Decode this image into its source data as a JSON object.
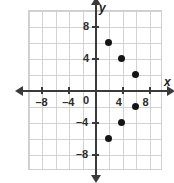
{
  "chart_data": {
    "type": "scatter",
    "title": "",
    "xlabel": "x",
    "ylabel": "y",
    "xlim": [
      -10,
      10
    ],
    "ylim": [
      -10,
      10
    ],
    "grid": true,
    "grid_step": 2,
    "legend": "none",
    "x_ticks": [
      -8,
      -4,
      4,
      8
    ],
    "y_ticks": [
      8,
      4,
      -4,
      -8
    ],
    "origin_label": "0",
    "x_tick_labels": [
      "–8",
      "–4",
      "4",
      "8"
    ],
    "y_tick_labels": [
      "8",
      "4",
      "–4",
      "–8"
    ],
    "point_color": "#151515",
    "axis_color": "#3a3a3a",
    "grid_color": "#d2d2d2",
    "points": [
      {
        "x": 2,
        "y": 6,
        "label": "(2, 6)"
      },
      {
        "x": 4,
        "y": 4,
        "label": "(4, 4)"
      },
      {
        "x": 6,
        "y": 2,
        "label": "(6, 2)"
      },
      {
        "x": 6,
        "y": -2,
        "label": "(6, -2)"
      },
      {
        "x": 4,
        "y": -4,
        "label": "(4, -4)"
      },
      {
        "x": 2,
        "y": -6,
        "label": "(2, -6)"
      }
    ]
  }
}
